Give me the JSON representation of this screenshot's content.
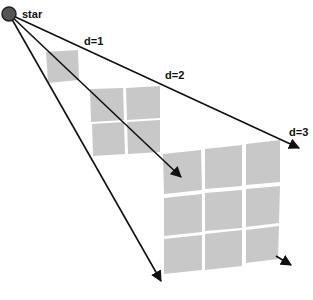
{
  "diagram": {
    "title": "",
    "source": {
      "label": "star",
      "cx": 9,
      "cy": 14,
      "r": 7,
      "fill": "#555555"
    },
    "distance_labels": [
      {
        "text": "d=1",
        "x": 84,
        "y": 45
      },
      {
        "text": "d=2",
        "x": 165,
        "y": 79
      },
      {
        "text": "d=3",
        "x": 289,
        "y": 136
      }
    ],
    "grids": [
      {
        "distance": 1,
        "divisions": 1,
        "corners": [
          [
            46,
            52
          ],
          [
            78,
            50
          ],
          [
            79,
            80
          ],
          [
            48,
            83
          ]
        ]
      },
      {
        "distance": 2,
        "divisions": 2,
        "corners": [
          [
            90,
            89
          ],
          [
            160,
            86
          ],
          [
            160,
            153
          ],
          [
            93,
            156
          ]
        ]
      },
      {
        "distance": 3,
        "divisions": 3,
        "corners": [
          [
            163,
            154
          ],
          [
            280,
            140
          ],
          [
            278,
            259
          ],
          [
            164,
            274
          ]
        ]
      }
    ],
    "rays": [
      {
        "from": [
          9,
          14
        ],
        "to": [
          300,
          148
        ]
      },
      {
        "from": [
          9,
          14
        ],
        "to": [
          181,
          177
        ]
      },
      {
        "from": [
          9,
          14
        ],
        "to": [
          161,
          281
        ]
      },
      {
        "from": [
          275,
          255
        ],
        "to": [
          291,
          265
        ]
      }
    ],
    "colors": {
      "tile": "#c8c8c8",
      "ray": "#111111",
      "background": "#ffffff"
    }
  }
}
